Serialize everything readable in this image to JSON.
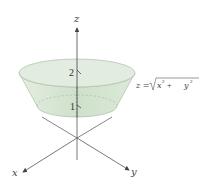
{
  "figure": {
    "axes": {
      "z_label": "z",
      "x_label": "x",
      "y_label": "y"
    },
    "ticks": {
      "upper": "2",
      "lower": "1"
    },
    "equation": {
      "lhs": "z = ",
      "radicand_x": "x",
      "exp_x": "2",
      "plus": " + ",
      "radicand_y": "y",
      "exp_y": "2"
    },
    "colors": {
      "surface_fill": "#d7e6d3",
      "surface_edge": "#9fb89a",
      "axis": "#555555"
    }
  }
}
